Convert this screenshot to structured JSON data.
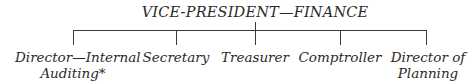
{
  "chart": {
    "root": "VICE-PRESIDENT—FINANCE",
    "children": [
      {
        "line1": "Director—Internal",
        "line2": "Auditing*"
      },
      {
        "line1": "Secretary",
        "line2": ""
      },
      {
        "line1": "Treasurer",
        "line2": ""
      },
      {
        "line1": "Comptroller",
        "line2": ""
      },
      {
        "line1": "Director of",
        "line2": "Planning"
      }
    ]
  }
}
